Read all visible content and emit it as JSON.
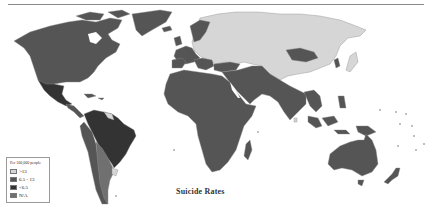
{
  "map": {
    "title": "Suicide Rates",
    "legend": {
      "title": "Per 100,000 people",
      "items": [
        {
          "label": ">13",
          "color": "#d6d6d6"
        },
        {
          "label": "6.5 - 13",
          "color": "#555555"
        },
        {
          "label": "<6.5",
          "color": "#333333"
        },
        {
          "label": "N/A",
          "color": "#707070"
        }
      ]
    },
    "colors": {
      "high": "#d6d6d6",
      "medium": "#555555",
      "low": "#333333",
      "na": "#707070",
      "border": "#8c8c8c",
      "background": "#ffffff"
    }
  }
}
